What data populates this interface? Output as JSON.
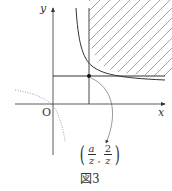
{
  "figure": {
    "caption": "図3",
    "axes": {
      "x_label": "x",
      "y_label": "y",
      "origin_label": "O"
    },
    "point_label": {
      "open_paren": "(",
      "close_paren": ")",
      "comma": ",",
      "x_numerator": "a",
      "x_denominator": "z",
      "y_numerator": "2",
      "y_denominator": "z"
    },
    "colors": {
      "line": "#333333",
      "hatch": "#666666",
      "dotted": "#888888"
    }
  }
}
